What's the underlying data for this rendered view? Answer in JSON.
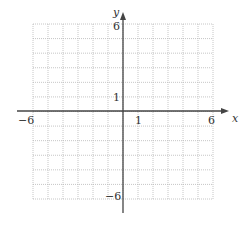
{
  "chart_data": {
    "type": "line",
    "title": "",
    "xlabel": "x",
    "ylabel": "y",
    "xlim": [
      -6,
      6
    ],
    "ylim": [
      -6,
      6
    ],
    "grid": true,
    "grid_step": 1,
    "x_tick_labels": [
      "-6",
      "1",
      "6"
    ],
    "y_tick_labels": [
      "6",
      "1",
      "-6"
    ],
    "series": []
  },
  "labels": {
    "x_axis": "x",
    "y_axis": "y",
    "x_neg": "−6",
    "x_one": "1",
    "x_pos": "6",
    "y_pos": "6",
    "y_one": "1",
    "y_neg": "−6"
  },
  "colors": {
    "grid": "#b8b8b8",
    "axis": "#444444"
  }
}
